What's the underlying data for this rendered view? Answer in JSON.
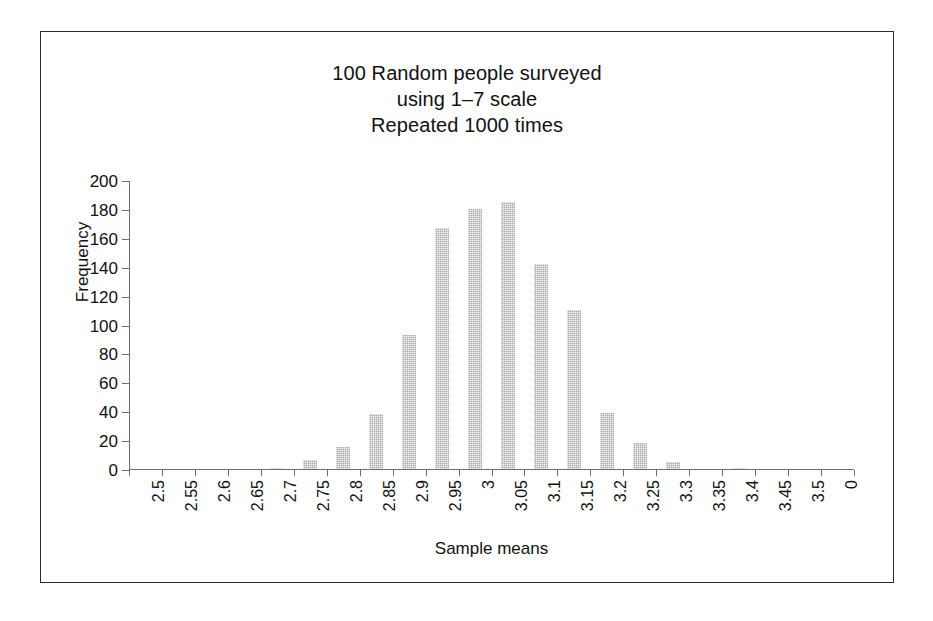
{
  "figure": {
    "title_lines": [
      "100 Random people surveyed",
      "using 1–7 scale",
      "Repeated 1000 times"
    ],
    "title_full": "100 Random people surveyed using 1–7 scale Repeated 1000 times",
    "bar_color": "#a9a9a9",
    "axis_color": "#6f6f6f",
    "frame_color": "#2b2b2b",
    "background": "#ffffff"
  },
  "chart_data": {
    "type": "bar",
    "title": "100 Random people surveyed using 1–7 scale Repeated 1000 times",
    "xlabel": "Sample means",
    "ylabel": "Frequency",
    "categories": [
      "2.5",
      "2.55",
      "2.6",
      "2.65",
      "2.7",
      "2.75",
      "2.8",
      "2.85",
      "2.9",
      "2.95",
      "3",
      "3.05",
      "3.1",
      "3.15",
      "3.2",
      "3.25",
      "3.3",
      "3.35",
      "3.4",
      "3.45",
      "3.5",
      "0"
    ],
    "values": [
      0,
      0,
      0,
      0,
      1,
      6,
      15,
      38,
      93,
      167,
      180,
      185,
      142,
      110,
      39,
      18,
      5,
      0,
      1,
      0,
      0,
      0
    ],
    "ylim": [
      0,
      200
    ],
    "yticks": [
      0,
      20,
      40,
      60,
      80,
      100,
      120,
      140,
      160,
      180,
      200
    ],
    "ytick_labels": [
      "0",
      "20",
      "40",
      "60",
      "80",
      "100",
      "120",
      "140",
      "160",
      "180",
      "200"
    ],
    "grid": false,
    "legend": null
  }
}
